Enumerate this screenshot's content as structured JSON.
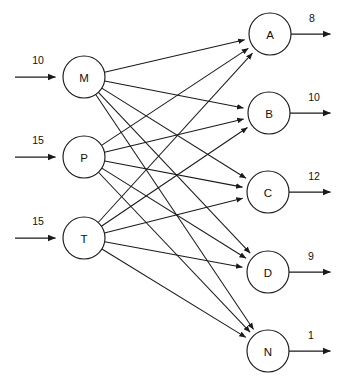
{
  "diagram": {
    "type": "bipartite-network",
    "background_color": "#ffffff",
    "stroke_color": "#1a1a1a",
    "text_color": "#111111",
    "node_fill": "#ffffff",
    "node_radius": 21
  },
  "source_nodes": [
    {
      "id": "M",
      "label": "M",
      "cx": 84,
      "cy": 77,
      "supply": "10",
      "supply_x": 38,
      "supply_y": 64,
      "arrow_start_x": 15,
      "arrow_end_x": 61
    },
    {
      "id": "P",
      "label": "P",
      "cx": 84,
      "cy": 157,
      "supply": "15",
      "supply_x": 38,
      "supply_y": 144,
      "arrow_start_x": 15,
      "arrow_end_x": 61
    },
    {
      "id": "T",
      "label": "T",
      "cx": 84,
      "cy": 238,
      "supply": "15",
      "supply_x": 38,
      "supply_y": 225,
      "arrow_start_x": 15,
      "arrow_end_x": 61
    }
  ],
  "sink_nodes": [
    {
      "id": "A",
      "label": "A",
      "cx": 270,
      "cy": 34,
      "demand": "8",
      "demand_x": 312,
      "demand_y": 22,
      "arrow_start_x": 291,
      "arrow_end_x": 336
    },
    {
      "id": "B",
      "label": "B",
      "cx": 269,
      "cy": 113,
      "demand": "10",
      "demand_x": 314,
      "demand_y": 101,
      "arrow_start_x": 290,
      "arrow_end_x": 336
    },
    {
      "id": "C",
      "label": "C",
      "cx": 268,
      "cy": 192,
      "demand": "12",
      "demand_x": 314,
      "demand_y": 180,
      "arrow_start_x": 289,
      "arrow_end_x": 336
    },
    {
      "id": "D",
      "label": "D",
      "cx": 268,
      "cy": 272,
      "demand": "9",
      "demand_x": 311,
      "demand_y": 260,
      "arrow_start_x": 289,
      "arrow_end_x": 336
    },
    {
      "id": "N",
      "label": "N",
      "cx": 268,
      "cy": 351,
      "demand": "1",
      "demand_x": 311,
      "demand_y": 339,
      "arrow_start_x": 289,
      "arrow_end_x": 336
    }
  ],
  "edges": [
    {
      "from": "M",
      "to": "A"
    },
    {
      "from": "M",
      "to": "B"
    },
    {
      "from": "M",
      "to": "C"
    },
    {
      "from": "M",
      "to": "D"
    },
    {
      "from": "M",
      "to": "N"
    },
    {
      "from": "P",
      "to": "A"
    },
    {
      "from": "P",
      "to": "B"
    },
    {
      "from": "P",
      "to": "C"
    },
    {
      "from": "P",
      "to": "D"
    },
    {
      "from": "P",
      "to": "N"
    },
    {
      "from": "T",
      "to": "A"
    },
    {
      "from": "T",
      "to": "B"
    },
    {
      "from": "T",
      "to": "C"
    },
    {
      "from": "T",
      "to": "D"
    },
    {
      "from": "T",
      "to": "N"
    }
  ]
}
